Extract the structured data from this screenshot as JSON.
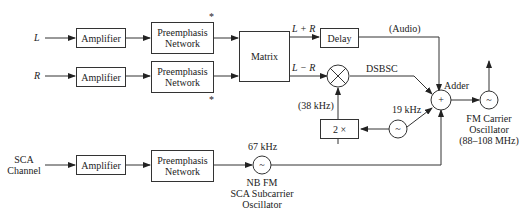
{
  "inputs": {
    "left": "L",
    "right": "R",
    "sca": "SCA\nChannel"
  },
  "blocks": {
    "amp_l": "Amplifier",
    "amp_r": "Amplifier",
    "amp_sca": "Amplifier",
    "pre_l": "Preemphasis\nNetwork",
    "pre_r": "Preemphasis\nNetwork",
    "pre_sca": "Preemphasis\nNetwork",
    "matrix": "Matrix",
    "delay": "Delay",
    "doubler": "2 ×"
  },
  "symbols": {
    "adder_plus": "+",
    "osc": "~",
    "asterisk": "*"
  },
  "labels": {
    "l_plus_r": "L + R",
    "l_minus_r": "L − R",
    "audio": "(Audio)",
    "dsbsc": "DSBSC",
    "adder": "Adder",
    "khz38": "(38 kHz)",
    "khz19": "19 kHz",
    "khz67": "67 kHz",
    "sca_osc": "NB FM\nSCA Subcarrier\nOscillator",
    "fm_osc": "FM Carrier\nOscillator\n(88–108 MHz)"
  }
}
